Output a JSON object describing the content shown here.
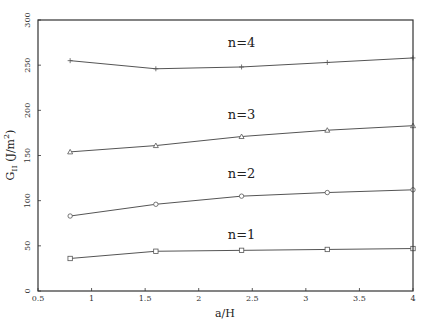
{
  "chart_data": {
    "type": "line",
    "title": "",
    "xlabel": "a/H",
    "ylabel": "G_II (J/m^2)",
    "xlim": [
      0.5,
      4
    ],
    "ylim": [
      0,
      300
    ],
    "grid": false,
    "legend": "inline labels",
    "x_ticks": [
      "0.5",
      "1",
      "1.5",
      "2",
      "2.5",
      "3",
      "3.5",
      "4"
    ],
    "y_ticks": [
      "0",
      "50",
      "100",
      "150",
      "200",
      "250",
      "300"
    ],
    "x": [
      0.8,
      1.6,
      2.4,
      3.2,
      4.0
    ],
    "series": [
      {
        "name": "n=4",
        "marker": "plus",
        "values": [
          255,
          246,
          248,
          253,
          258
        ]
      },
      {
        "name": "n=3",
        "marker": "triangle",
        "values": [
          154,
          161,
          171,
          178,
          183
        ]
      },
      {
        "name": "n=2",
        "marker": "circle",
        "values": [
          83,
          96,
          105,
          109,
          112
        ]
      },
      {
        "name": "n=1",
        "marker": "square",
        "values": [
          36,
          44,
          45,
          46,
          47
        ]
      }
    ],
    "annotations": [
      {
        "text": "n=4",
        "x": 2.4,
        "y": 270
      },
      {
        "text": "n=3",
        "x": 2.4,
        "y": 190
      },
      {
        "text": "n=2",
        "x": 2.4,
        "y": 125
      },
      {
        "text": "n=1",
        "x": 2.4,
        "y": 58
      }
    ]
  },
  "colors": {
    "frame": "#333333",
    "line": "#555555",
    "text": "#222222"
  }
}
